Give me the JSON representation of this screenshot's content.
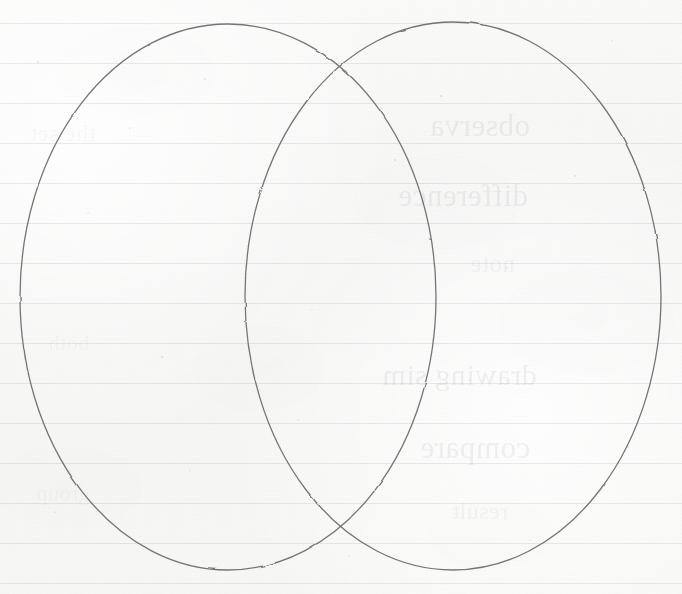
{
  "document": {
    "kind": "handwritten-notebook-page",
    "medium": "ruled paper",
    "title": "Venn Diagram"
  },
  "paper": {
    "background_color": "#f7f7f6",
    "rule_color": "#788696",
    "rule_spacing_px": 40,
    "rule_positions_y": [
      23,
      63,
      103,
      143,
      183,
      223,
      263,
      303,
      343,
      383,
      423,
      463,
      503,
      543,
      583
    ]
  },
  "drawing": {
    "type": "venn-diagram",
    "set_count": 2,
    "ink_color": "#6a6a6a",
    "stroke_width_px": 1.3,
    "shapes": [
      {
        "name": "left-set-ellipse",
        "cx": 228,
        "cy": 297,
        "rx": 208,
        "ry": 273,
        "label": ""
      },
      {
        "name": "right-set-ellipse",
        "cx": 453,
        "cy": 296,
        "rx": 208,
        "ry": 274,
        "label": ""
      }
    ],
    "intersection_points": [
      {
        "name": "upper-crossing",
        "x": 341,
        "y": 69
      },
      {
        "name": "lower-crossing",
        "x": 342,
        "y": 523
      }
    ],
    "regions": [
      {
        "name": "left-only-region",
        "label": ""
      },
      {
        "name": "overlap-region",
        "label": ""
      },
      {
        "name": "right-only-region",
        "label": ""
      }
    ]
  },
  "show_through": {
    "description": "faint mirrored ink bleeding through from the reverse side of the sheet",
    "blocks": [
      {
        "name": "upper-bleed-block",
        "lines": [
          {
            "text": "observa",
            "x": 430,
            "y": 108,
            "size": 31,
            "weight": 1
          },
          {
            "text": "difference",
            "x": 398,
            "y": 178,
            "size": 31,
            "weight": 1
          },
          {
            "text": "note",
            "x": 470,
            "y": 250,
            "size": 25,
            "weight": 2
          }
        ]
      },
      {
        "name": "lower-bleed-block",
        "lines": [
          {
            "text": "drawing sim",
            "x": 382,
            "y": 358,
            "size": 30,
            "weight": 1
          },
          {
            "text": "compare",
            "x": 420,
            "y": 430,
            "size": 31,
            "weight": 1
          },
          {
            "text": "result",
            "x": 452,
            "y": 498,
            "size": 24,
            "weight": 2
          }
        ]
      },
      {
        "name": "margin-bleed-block",
        "lines": [
          {
            "text": "the set",
            "x": 30,
            "y": 120,
            "size": 24,
            "weight": 3
          },
          {
            "text": "both",
            "x": 48,
            "y": 330,
            "size": 22,
            "weight": 3
          },
          {
            "text": "group",
            "x": 36,
            "y": 480,
            "size": 22,
            "weight": 3
          }
        ]
      }
    ]
  }
}
